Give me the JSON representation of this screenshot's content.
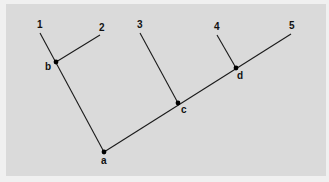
{
  "diagram": {
    "type": "cladogram",
    "background_color": "#dadada",
    "line_color": "#1a1a1a",
    "leaves": [
      {
        "id": "1",
        "label": "1",
        "x": 40,
        "y": 33,
        "lx": 37,
        "ly": 28
      },
      {
        "id": "2",
        "label": "2",
        "x": 100,
        "y": 35,
        "lx": 99,
        "ly": 31
      },
      {
        "id": "3",
        "label": "3",
        "x": 140,
        "y": 33,
        "lx": 137,
        "ly": 28
      },
      {
        "id": "4",
        "label": "4",
        "x": 217,
        "y": 35,
        "lx": 214,
        "ly": 30
      },
      {
        "id": "5",
        "label": "5",
        "x": 291,
        "y": 34,
        "lx": 289,
        "ly": 29
      }
    ],
    "nodes": [
      {
        "id": "b",
        "label": "b",
        "x": 56,
        "y": 62,
        "lx": 45,
        "ly": 70
      },
      {
        "id": "d",
        "label": "d",
        "x": 236,
        "y": 68,
        "lx": 237,
        "ly": 79
      },
      {
        "id": "c",
        "label": "c",
        "x": 178,
        "y": 103,
        "lx": 181,
        "ly": 113
      },
      {
        "id": "a",
        "label": "a",
        "x": 104,
        "y": 152,
        "lx": 101,
        "ly": 164
      }
    ],
    "edges": [
      {
        "from": "1",
        "to": "a"
      },
      {
        "from": "2",
        "to": "b"
      },
      {
        "from": "3",
        "to": "c"
      },
      {
        "from": "4",
        "to": "d"
      },
      {
        "from": "5",
        "to": "a"
      }
    ]
  }
}
